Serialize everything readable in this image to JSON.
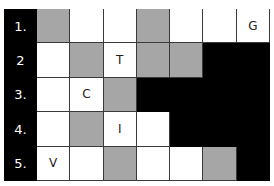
{
  "puzzle": {
    "rows": [
      {
        "label": "1.",
        "cells": [
          {
            "shade": "gray",
            "letter": ""
          },
          {
            "shade": "white",
            "letter": ""
          },
          {
            "shade": "white",
            "letter": ""
          },
          {
            "shade": "gray",
            "letter": ""
          },
          {
            "shade": "white",
            "letter": ""
          },
          {
            "shade": "white",
            "letter": ""
          },
          {
            "shade": "white",
            "letter": "G"
          }
        ]
      },
      {
        "label": "2",
        "cells": [
          {
            "shade": "white",
            "letter": ""
          },
          {
            "shade": "gray",
            "letter": ""
          },
          {
            "shade": "white",
            "letter": "T"
          },
          {
            "shade": "gray",
            "letter": ""
          },
          {
            "shade": "gray",
            "letter": ""
          },
          {
            "shade": "black",
            "letter": ""
          },
          {
            "shade": "black",
            "letter": ""
          }
        ]
      },
      {
        "label": "3.",
        "cells": [
          {
            "shade": "white",
            "letter": ""
          },
          {
            "shade": "white",
            "letter": "C"
          },
          {
            "shade": "gray",
            "letter": ""
          },
          {
            "shade": "black",
            "letter": ""
          },
          {
            "shade": "black",
            "letter": ""
          },
          {
            "shade": "black",
            "letter": ""
          },
          {
            "shade": "black",
            "letter": ""
          }
        ]
      },
      {
        "label": "4.",
        "cells": [
          {
            "shade": "white",
            "letter": ""
          },
          {
            "shade": "gray",
            "letter": ""
          },
          {
            "shade": "white",
            "letter": "I"
          },
          {
            "shade": "white",
            "letter": ""
          },
          {
            "shade": "black",
            "letter": ""
          },
          {
            "shade": "black",
            "letter": ""
          },
          {
            "shade": "black",
            "letter": ""
          }
        ]
      },
      {
        "label": "5.",
        "cells": [
          {
            "shade": "white",
            "letter": "V"
          },
          {
            "shade": "white",
            "letter": ""
          },
          {
            "shade": "gray",
            "letter": ""
          },
          {
            "shade": "white",
            "letter": ""
          },
          {
            "shade": "white",
            "letter": ""
          },
          {
            "shade": "gray",
            "letter": ""
          },
          {
            "shade": "black",
            "letter": ""
          }
        ]
      }
    ]
  }
}
